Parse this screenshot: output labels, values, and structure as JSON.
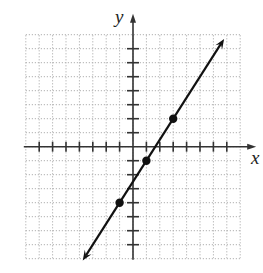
{
  "chart_data": {
    "type": "line",
    "title": "",
    "xlabel": "x",
    "ylabel": "y",
    "xlim": [
      -8,
      8
    ],
    "ylim": [
      -8,
      8
    ],
    "grid": true,
    "grid_style": "dotted",
    "tick_step": 1,
    "x_ticks": [
      -7,
      -6,
      -5,
      -4,
      -3,
      -2,
      -1,
      1,
      2,
      3,
      4,
      5,
      6,
      7
    ],
    "y_ticks": [
      -7,
      -6,
      -5,
      -4,
      -3,
      -2,
      -1,
      1,
      2,
      3,
      4,
      5,
      6,
      7
    ],
    "line": {
      "equation": "y = (3/2)x - 5/2",
      "slope": 1.5,
      "intercept": -2.5,
      "arrows": "both",
      "x_start": -3.75,
      "x_end": 6.8,
      "color": "#111111"
    },
    "points": [
      {
        "x": -1,
        "y": -4
      },
      {
        "x": 1,
        "y": -1
      },
      {
        "x": 3,
        "y": 2
      }
    ],
    "colors": {
      "axis": "#333333",
      "grid": "#b0b0b0",
      "point": "#111111"
    }
  }
}
